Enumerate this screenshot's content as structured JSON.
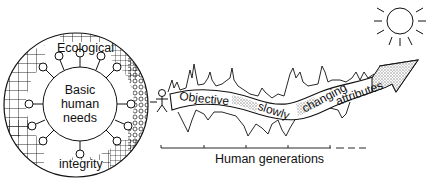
{
  "diagram": {
    "circle": {
      "outer_label_top": "Ecological",
      "outer_label_bottom": "integrity",
      "inner_label_lines": [
        "Basic",
        "human",
        "needs"
      ]
    },
    "ribbon": {
      "words": [
        "Objective",
        "slowly",
        "changing",
        "attributes"
      ]
    },
    "timeline": {
      "label": "Human generations"
    },
    "icons": [
      "sun-icon",
      "human-figure-icon",
      "arrow-icon"
    ],
    "colors": {
      "ink": "#111111",
      "background": "#ffffff",
      "stipple": "#9a9a9a"
    }
  }
}
